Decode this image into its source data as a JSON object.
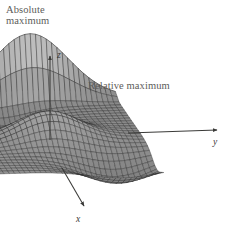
{
  "figure": {
    "title_absolute": "Absolute\nmaximum",
    "title_relative": "Relative maximum",
    "background_color": "#ffffff",
    "annotation_color": "#5d5c5a",
    "axis_color": "#3a3a38",
    "mesh_color": "#2a2a2a",
    "surface_fill": "#9a9a9a"
  },
  "axes": {
    "z_label": "z",
    "y_label": "y",
    "x_label": "x",
    "z_axis": {
      "x1": 50,
      "y1": 140,
      "x2": 50,
      "y2": 56
    },
    "y_axis": {
      "x1": 128,
      "y1": 133,
      "x2": 217,
      "y2": 130
    },
    "x_axis": {
      "x1": 62,
      "y1": 168,
      "x2": 84,
      "y2": 206
    }
  },
  "chart_data": {
    "type": "surface",
    "title": "",
    "xlabel": "x",
    "ylabel": "y",
    "zlabel": "z",
    "features": [
      {
        "name": "Absolute maximum",
        "kind": "absolute-maximum",
        "screen_x": 30,
        "screen_y": 36
      },
      {
        "name": "Relative maximum",
        "kind": "relative-maximum",
        "screen_x": 130,
        "screen_y": 103
      }
    ],
    "grid": true,
    "legend": "none",
    "projection": {
      "azimuth_deg": -62,
      "elevation_deg": 22,
      "origin_x": 50,
      "origin_y": 133,
      "y_axis_vec": [
        1.22,
        -0.042
      ],
      "x_axis_vec": [
        0.5,
        0.86
      ],
      "z_scale": 1.0
    },
    "domain": {
      "u_min": -1.0,
      "u_max": 1.0,
      "v_min": -1.0,
      "v_max": 1.0
    },
    "resolution": {
      "nu": 30,
      "nv": 34
    },
    "surface_expression": "f(u,v) = 3.10*exp(-((u+0.86)/0.085)^2-((v-0.02)/0.62)^2) + 1.22*exp(-((u-0.12)/0.26)^2-((v+0.05)/0.50)^2) - 0.98*exp(-((u+0.44)/0.24)^2-((v+0.40)/0.46)^2) - 1.05*exp(-((u-0.74)/0.26)^2-((v-0.55)/0.55)^2) + 0.30*u",
    "zlim": [
      -1.3,
      3.2
    ],
    "ylim": [
      -1.0,
      1.0
    ],
    "xlim": [
      -1.0,
      1.0
    ]
  }
}
